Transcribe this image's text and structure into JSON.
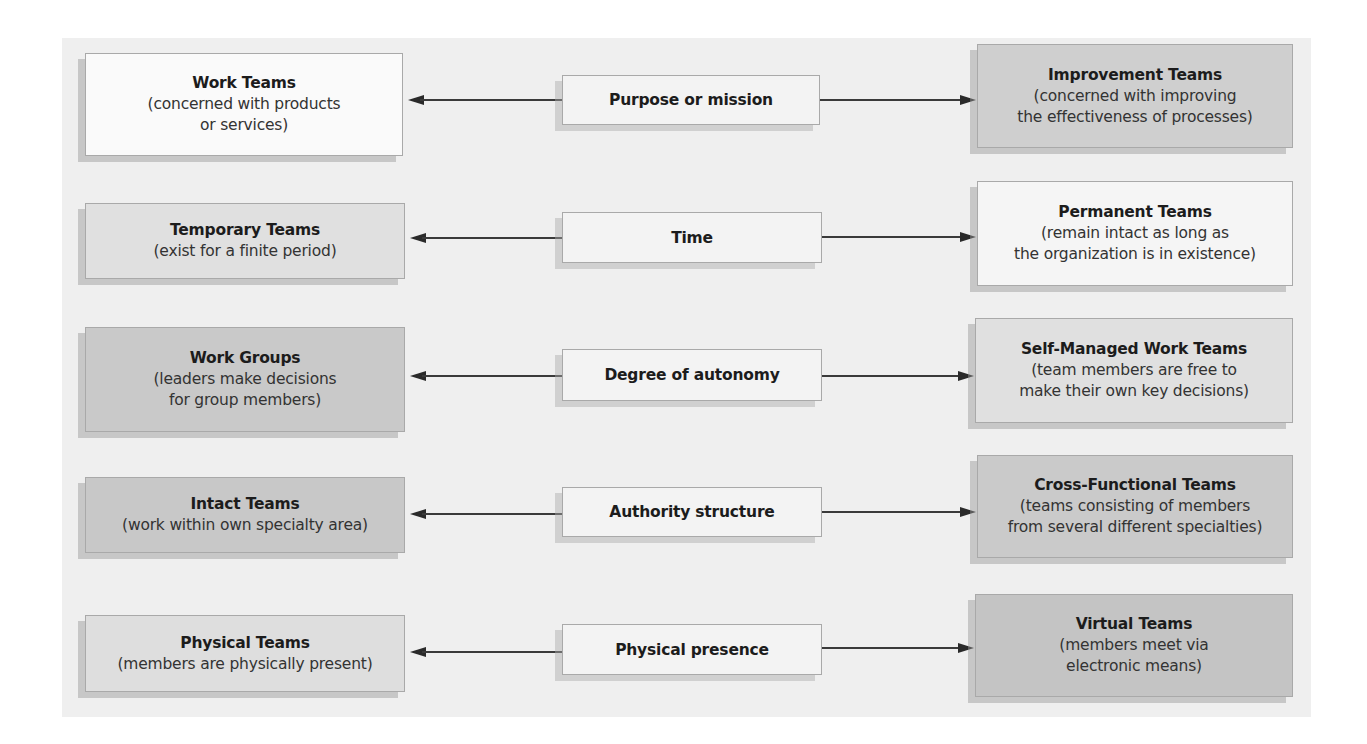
{
  "diagram": {
    "rows": [
      {
        "dimension": "Purpose or mission",
        "left": {
          "title": "Work Teams",
          "desc_lines": [
            "(concerned with products",
            "or services)"
          ],
          "fill": "#fafafa"
        },
        "right": {
          "title": "Improvement Teams",
          "desc_lines": [
            "(concerned with improving",
            "the effectiveness of processes)"
          ],
          "fill": "#cfcfcf"
        }
      },
      {
        "dimension": "Time",
        "left": {
          "title": "Temporary Teams",
          "desc_lines": [
            "(exist for a finite period)"
          ],
          "fill": "#e0e0e0"
        },
        "right": {
          "title": "Permanent Teams",
          "desc_lines": [
            "(remain intact as long as",
            "the organization is in existence)"
          ],
          "fill": "#f5f5f5"
        }
      },
      {
        "dimension": "Degree of autonomy",
        "left": {
          "title": "Work Groups",
          "desc_lines": [
            "(leaders make decisions",
            "for group members)"
          ],
          "fill": "#c9c9c9"
        },
        "right": {
          "title": "Self-Managed Work Teams",
          "desc_lines": [
            "(team members are free to",
            "make their own key decisions)"
          ],
          "fill": "#e0e0e0"
        }
      },
      {
        "dimension": "Authority structure",
        "left": {
          "title": "Intact Teams",
          "desc_lines": [
            "(work within own specialty area)"
          ],
          "fill": "#c8c8c8"
        },
        "right": {
          "title": "Cross-Functional Teams",
          "desc_lines": [
            "(teams consisting of members",
            "from several different specialties)"
          ],
          "fill": "#cacaca"
        }
      },
      {
        "dimension": "Physical presence",
        "left": {
          "title": "Physical Teams",
          "desc_lines": [
            "(members are physically present)"
          ],
          "fill": "#dedede"
        },
        "right": {
          "title": "Virtual Teams",
          "desc_lines": [
            "(members meet via",
            "electronic means)"
          ],
          "fill": "#c4c4c4"
        }
      }
    ],
    "icons": {
      "arrow_left": "arrow-left-icon",
      "arrow_right": "arrow-right-icon"
    },
    "colors": {
      "panel_bg": "#efefef",
      "center_fill": "#f3f3f3",
      "border": "#a9a9a9",
      "arrow": "#2a2a2a"
    }
  }
}
